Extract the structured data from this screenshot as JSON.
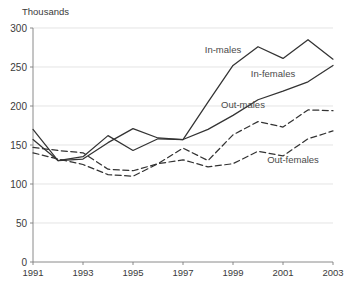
{
  "chart_data": {
    "type": "line",
    "title": "",
    "subtitle": "",
    "unit_label": "Thousands",
    "xlabel": "",
    "ylabel": "",
    "x": [
      1991,
      1992,
      1993,
      1994,
      1995,
      1996,
      1997,
      1998,
      1999,
      2000,
      2001,
      2002,
      2003
    ],
    "xlim": [
      1991,
      2003
    ],
    "ylim": [
      0,
      300
    ],
    "y_ticks": [
      0,
      50,
      100,
      150,
      200,
      250,
      300
    ],
    "y_tick_labels": [
      "0",
      "50",
      "100",
      "150",
      "200",
      "250",
      "300"
    ],
    "x_ticks": [
      1991,
      1993,
      1995,
      1997,
      1999,
      2001,
      2003
    ],
    "x_tick_labels": [
      "1991",
      "1993",
      "1995",
      "1997",
      "1999",
      "2001",
      "2003"
    ],
    "grid": "horizontal",
    "legend_position": "inline-annotations",
    "series": [
      {
        "name": "In-males",
        "style": "solid",
        "color": "#333333",
        "label_x": 1998.6,
        "label_y": 268,
        "values": [
          170,
          130,
          135,
          162,
          143,
          158,
          157,
          205,
          252,
          276,
          261,
          285,
          260
        ]
      },
      {
        "name": "In-females",
        "style": "solid",
        "color": "#333333",
        "label_x": 2000.6,
        "label_y": 237,
        "values": [
          157,
          130,
          132,
          153,
          171,
          159,
          157,
          170,
          188,
          208,
          219,
          231,
          252
        ]
      },
      {
        "name": "Out-males",
        "style": "dashed",
        "color": "#333333",
        "label_x": 1999.4,
        "label_y": 198,
        "values": [
          147,
          143,
          140,
          119,
          117,
          126,
          146,
          130,
          163,
          180,
          173,
          195,
          194
        ]
      },
      {
        "name": "Out-females",
        "style": "dashed",
        "color": "#333333",
        "label_x": 2001.4,
        "label_y": 127,
        "values": [
          140,
          132,
          125,
          112,
          110,
          126,
          131,
          122,
          126,
          142,
          136,
          158,
          168
        ]
      }
    ]
  },
  "colors": {
    "background": "#ffffff",
    "line": "#333333",
    "grid": "#d8d8d8",
    "axis": "#7d7d7d",
    "text": "#3a3a3a"
  }
}
